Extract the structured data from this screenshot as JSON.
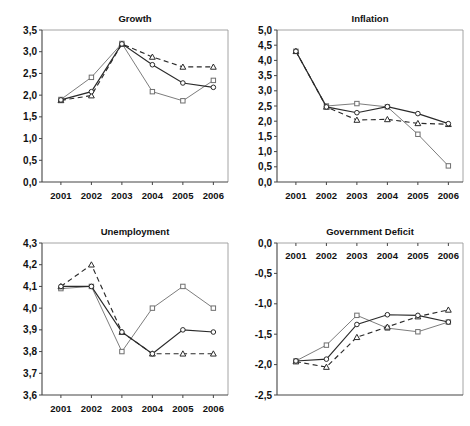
{
  "figure": {
    "panel_count": 4,
    "background": "#ffffff",
    "decimal_separator": ",",
    "marker_shapes": [
      "circle",
      "square",
      "triangle"
    ]
  },
  "colors": {
    "axis": "#444444",
    "frame": "#9a9a9a",
    "series_circle": "#2a2a2a",
    "series_square": "#7d7d7d",
    "series_triangle": "#2a2a2a",
    "text": "#111111",
    "marker_fill": "#ffffff"
  },
  "chart_data": [
    {
      "id": "growth",
      "type": "line",
      "title": "Growth",
      "xlabel": "",
      "ylabel": "",
      "categories": [
        "2001",
        "2002",
        "2003",
        "2004",
        "2005",
        "2006"
      ],
      "x": [
        2001,
        2002,
        2003,
        2004,
        2005,
        2006
      ],
      "ylim": [
        0.0,
        3.5
      ],
      "ytick_labels": [
        "0,0",
        "0,5",
        "1,0",
        "1,5",
        "2,0",
        "2,5",
        "3,0",
        "3,5"
      ],
      "ytick_values": [
        0.0,
        0.5,
        1.0,
        1.5,
        2.0,
        2.5,
        3.0,
        3.5
      ],
      "grid": false,
      "legend": "none",
      "series": [
        {
          "name": "circle-series",
          "marker": "circle",
          "style": "solid",
          "values": [
            1.89,
            2.08,
            3.18,
            2.7,
            2.28,
            2.18
          ]
        },
        {
          "name": "square-series",
          "marker": "square",
          "style": "solid",
          "values": [
            1.9,
            2.41,
            3.19,
            2.08,
            1.87,
            2.34
          ]
        },
        {
          "name": "triangle-series",
          "marker": "triangle",
          "style": "dashed",
          "values": [
            1.88,
            1.99,
            3.18,
            2.88,
            2.65,
            2.65
          ]
        }
      ]
    },
    {
      "id": "inflation",
      "type": "line",
      "title": "Inflation",
      "xlabel": "",
      "ylabel": "",
      "categories": [
        "2001",
        "2002",
        "2003",
        "2004",
        "2005",
        "2006"
      ],
      "x": [
        2001,
        2002,
        2003,
        2004,
        2005,
        2006
      ],
      "ylim": [
        0.0,
        5.0
      ],
      "ytick_labels": [
        "0,0",
        "0,5",
        "1,0",
        "1,5",
        "2,0",
        "2,5",
        "3,0",
        "3,5",
        "4,0",
        "4,5",
        "5,0"
      ],
      "ytick_values": [
        0.0,
        0.5,
        1.0,
        1.5,
        2.0,
        2.5,
        3.0,
        3.5,
        4.0,
        4.5,
        5.0
      ],
      "grid": false,
      "legend": "none",
      "series": [
        {
          "name": "circle-series",
          "marker": "circle",
          "style": "solid",
          "values": [
            4.3,
            2.47,
            2.28,
            2.48,
            2.25,
            1.92
          ]
        },
        {
          "name": "square-series",
          "marker": "square",
          "style": "solid",
          "values": [
            4.3,
            2.5,
            2.58,
            2.47,
            1.57,
            0.53
          ]
        },
        {
          "name": "triangle-series",
          "marker": "triangle",
          "style": "dashed",
          "values": [
            4.3,
            2.47,
            2.04,
            2.06,
            1.93,
            1.9
          ]
        }
      ]
    },
    {
      "id": "unemployment",
      "type": "line",
      "title": "Unemployment",
      "xlabel": "",
      "ylabel": "",
      "categories": [
        "2001",
        "2002",
        "2003",
        "2004",
        "2005",
        "2006"
      ],
      "x": [
        2001,
        2002,
        2003,
        2004,
        2005,
        2006
      ],
      "ylim": [
        3.6,
        4.3
      ],
      "ytick_labels": [
        "3,6",
        "3,7",
        "3,8",
        "3,9",
        "4,0",
        "4,1",
        "4,2",
        "4,3"
      ],
      "ytick_values": [
        3.6,
        3.7,
        3.8,
        3.9,
        4.0,
        4.1,
        4.2,
        4.3
      ],
      "grid": false,
      "legend": "none",
      "series": [
        {
          "name": "circle-series",
          "marker": "circle",
          "style": "solid",
          "values": [
            4.1,
            4.1,
            3.89,
            3.79,
            3.9,
            3.89
          ]
        },
        {
          "name": "square-series",
          "marker": "square",
          "style": "solid",
          "values": [
            4.09,
            4.1,
            3.8,
            4.0,
            4.1,
            4.0
          ]
        },
        {
          "name": "triangle-series",
          "marker": "triangle",
          "style": "dashed",
          "values": [
            4.1,
            4.2,
            3.89,
            3.79,
            3.79,
            3.79
          ]
        }
      ]
    },
    {
      "id": "government-deficit",
      "type": "line",
      "title": "Government Deficit",
      "xlabel": "",
      "ylabel": "",
      "categories": [
        "2001",
        "2002",
        "2003",
        "2004",
        "2005",
        "2006"
      ],
      "x": [
        2001,
        2002,
        2003,
        2004,
        2005,
        2006
      ],
      "ylim": [
        -2.5,
        0.0
      ],
      "xaxis_labels_position": "top",
      "ytick_labels": [
        "0,0",
        "-0,5",
        "-1,0",
        "-1,5",
        "-2,0",
        "-2,5"
      ],
      "ytick_values": [
        0.0,
        -0.5,
        -1.0,
        -1.5,
        -2.0,
        -2.5
      ],
      "grid": false,
      "legend": "none",
      "series": [
        {
          "name": "circle-series",
          "marker": "circle",
          "style": "solid",
          "values": [
            -1.94,
            -1.91,
            -1.34,
            -1.18,
            -1.19,
            -1.3
          ]
        },
        {
          "name": "square-series",
          "marker": "square",
          "style": "solid",
          "values": [
            -1.94,
            -1.68,
            -1.19,
            -1.4,
            -1.46,
            -1.3
          ]
        },
        {
          "name": "triangle-series",
          "marker": "triangle",
          "style": "dashed",
          "values": [
            -1.95,
            -2.04,
            -1.55,
            -1.38,
            -1.21,
            -1.1
          ]
        }
      ]
    }
  ]
}
